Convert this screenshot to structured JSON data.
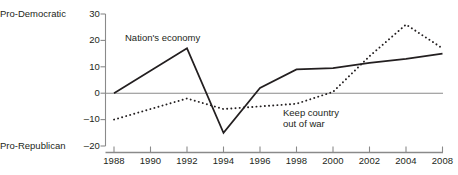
{
  "chart_data": {
    "type": "line",
    "title": "",
    "subtitle": "",
    "xlabel": "",
    "ylabel": "",
    "ylim": [
      -20,
      30
    ],
    "yticks": [
      "30",
      "20",
      "10",
      "0",
      "–10",
      "–20"
    ],
    "ytick_values": [
      30,
      20,
      10,
      0,
      -10,
      -20
    ],
    "grid": false,
    "legend_position": "inline-annotation",
    "axis_captions": {
      "top": "Pro-Democratic",
      "bottom": "Pro-Republican"
    },
    "categories": [
      "1988",
      "1990",
      "1992",
      "1994",
      "1996",
      "1998",
      "2000",
      "2002",
      "2004",
      "2008"
    ],
    "x": [
      1988,
      1990,
      1992,
      1994,
      1996,
      1998,
      2000,
      2002,
      2004,
      2008
    ],
    "series": [
      {
        "name": "Nation's economy",
        "style": "solid",
        "color": "#231f20",
        "values": [
          0,
          8.5,
          17,
          -15,
          2,
          9,
          9.5,
          11.5,
          13,
          15
        ]
      },
      {
        "name": "Keep country out of war",
        "style": "dotted",
        "color": "#231f20",
        "values": [
          -10,
          -6,
          -2,
          -6,
          -5,
          -4,
          0.5,
          14,
          26,
          17
        ]
      }
    ],
    "annotations": [
      {
        "text": "Nation's economy",
        "series": "Nation's economy"
      },
      {
        "text": "Keep country\nout of war",
        "series": "Keep country out of war"
      }
    ]
  },
  "labels": {
    "series_1": "Nation's economy",
    "series_2_line1": "Keep country",
    "series_2_line2": "out of war",
    "caption_top": "Pro-Democratic",
    "caption_bottom": "Pro-Republican",
    "y_30": "30",
    "y_20": "20",
    "y_10": "10",
    "y_0": "0",
    "y_neg10": "–10",
    "y_neg20": "–20",
    "x_1988": "1988",
    "x_1990": "1990",
    "x_1992": "1992",
    "x_1994": "1994",
    "x_1996": "1996",
    "x_1998": "1998",
    "x_2000": "2000",
    "x_2002": "2002",
    "x_2004": "2004",
    "x_2008": "2008"
  },
  "colors": {
    "ink": "#231f20",
    "axis": "#8a8a8a",
    "zero_line": "#8a8a8a",
    "background": "#ffffff"
  }
}
